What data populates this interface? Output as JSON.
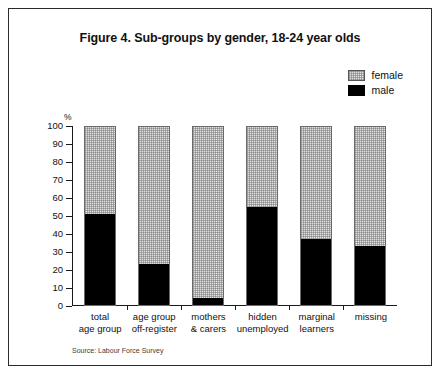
{
  "figure": {
    "title": "Figure 4. Sub-groups by gender, 18-24 year olds",
    "source_note": "Source: Labour Force Survey",
    "unit_label": "%"
  },
  "legend": {
    "position": "top-right",
    "entries": [
      {
        "label": "female",
        "color": "#e2e2e2",
        "pattern": "stipple"
      },
      {
        "label": "male",
        "color": "#000000",
        "pattern": "solid"
      }
    ]
  },
  "axis": {
    "y_ticks": [
      "100",
      "90",
      "80",
      "70",
      "60",
      "50",
      "40",
      "30",
      "20",
      "10",
      "0"
    ]
  },
  "chart_data": {
    "type": "bar",
    "stacked": true,
    "title": "Figure 4. Sub-groups by gender, 18-24 year olds",
    "xlabel": "",
    "ylabel": "%",
    "ylim": [
      0,
      100
    ],
    "ytick_step": 10,
    "grid": false,
    "legend_position": "top-right",
    "annotations": [
      "Source: Labour Force Survey"
    ],
    "categories": [
      "total age group",
      "age group off-register",
      "mothers & carers",
      "hidden unemployed",
      "marginal learners",
      "missing"
    ],
    "category_label_lines": [
      [
        "total",
        "age group"
      ],
      [
        "age group",
        "off-register"
      ],
      [
        "mothers",
        "& carers"
      ],
      [
        "hidden",
        "unemployed"
      ],
      [
        "marginal",
        "learners"
      ],
      [
        "missing"
      ]
    ],
    "series": [
      {
        "name": "male",
        "color": "#000000",
        "values": [
          51,
          23,
          4,
          55,
          37,
          33
        ]
      },
      {
        "name": "female",
        "color": "#e2e2e2",
        "values": [
          49,
          77,
          96,
          45,
          63,
          67
        ]
      }
    ]
  }
}
